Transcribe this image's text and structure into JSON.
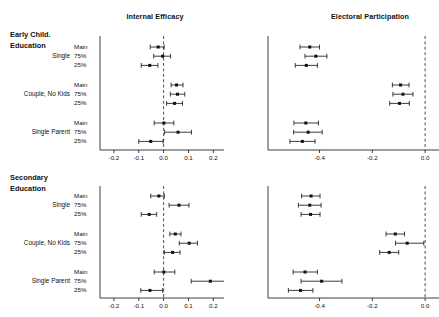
{
  "figure": {
    "width": 439,
    "height": 317,
    "background": "#ffffff",
    "ink_color": "#111111"
  },
  "panels": {
    "top_left_title": "Internal Efficacy",
    "top_right_title": "Electoral Participation",
    "row_block_1_line1": "Early Child.",
    "row_block_1_line2": "Education",
    "row_block_2_line1": "Secondary",
    "row_block_2_line2": "Education",
    "groups": [
      "Single",
      "Couple, No Kids",
      "Single Parent"
    ],
    "subrows": [
      "Main",
      "75%",
      "25%"
    ]
  },
  "axes": {
    "efficacy_ticks": [
      "-0.2",
      "-0.1",
      "0.0",
      "0.1",
      "0.2"
    ],
    "efficacy_tick_values": [
      -0.2,
      -0.1,
      0.0,
      0.1,
      0.2
    ],
    "efficacy_xlim": [
      -0.24,
      0.235
    ],
    "participation_ticks": [
      "-0.4",
      "-0.2",
      "0.0"
    ],
    "participation_tick_values": [
      -0.4,
      -0.2,
      0.0
    ],
    "participation_xlim": [
      -0.58,
      0.045
    ],
    "reference_line": 0.0,
    "grid": false
  },
  "chart_data": {
    "type": "scatter",
    "title": "",
    "subtitle": "",
    "xlabel": "",
    "ylabel": "",
    "legend_position": "none",
    "annotations": [
      "Dashed vertical line marks zero (no effect)"
    ],
    "panels": [
      {
        "row_block": "Early Child. Education",
        "column": "Internal Efficacy",
        "xlabel": "",
        "xlim": [
          -0.24,
          0.235
        ],
        "ticks": [
          -0.2,
          -0.1,
          0.0,
          0.1,
          0.2
        ],
        "points": [
          {
            "group": "Single",
            "spec": "Main",
            "estimate": -0.022,
            "ci_low": -0.054,
            "ci_high": 0.002
          },
          {
            "group": "Single",
            "spec": "75%",
            "estimate": -0.004,
            "ci_low": -0.04,
            "ci_high": 0.028
          },
          {
            "group": "Single",
            "spec": "25%",
            "estimate": -0.056,
            "ci_low": -0.09,
            "ci_high": -0.023
          },
          {
            "group": "Couple, No Kids",
            "spec": "Main",
            "estimate": 0.052,
            "ci_low": 0.03,
            "ci_high": 0.078
          },
          {
            "group": "Couple, No Kids",
            "spec": "75%",
            "estimate": 0.056,
            "ci_low": 0.027,
            "ci_high": 0.085
          },
          {
            "group": "Couple, No Kids",
            "spec": "25%",
            "estimate": 0.044,
            "ci_low": 0.012,
            "ci_high": 0.076
          },
          {
            "group": "Single Parent",
            "spec": "Main",
            "estimate": 0.001,
            "ci_low": -0.038,
            "ci_high": 0.041
          },
          {
            "group": "Single Parent",
            "spec": "75%",
            "estimate": 0.058,
            "ci_low": 0.004,
            "ci_high": 0.112
          },
          {
            "group": "Single Parent",
            "spec": "25%",
            "estimate": -0.052,
            "ci_low": -0.1,
            "ci_high": -0.002
          }
        ]
      },
      {
        "row_block": "Early Child. Education",
        "column": "Electoral Participation",
        "xlabel": "",
        "xlim": [
          -0.58,
          0.045
        ],
        "ticks": [
          -0.4,
          -0.2,
          0.0
        ],
        "points": [
          {
            "group": "Single",
            "spec": "Main",
            "estimate": -0.437,
            "ci_low": -0.474,
            "ci_high": -0.4
          },
          {
            "group": "Single",
            "spec": "75%",
            "estimate": -0.414,
            "ci_low": -0.455,
            "ci_high": -0.372
          },
          {
            "group": "Single",
            "spec": "25%",
            "estimate": -0.45,
            "ci_low": -0.492,
            "ci_high": -0.408
          },
          {
            "group": "Couple, No Kids",
            "spec": "Main",
            "estimate": -0.093,
            "ci_low": -0.124,
            "ci_high": -0.061
          },
          {
            "group": "Couple, No Kids",
            "spec": "75%",
            "estimate": -0.084,
            "ci_low": -0.122,
            "ci_high": -0.046
          },
          {
            "group": "Couple, No Kids",
            "spec": "25%",
            "estimate": -0.097,
            "ci_low": -0.134,
            "ci_high": -0.06
          },
          {
            "group": "Single Parent",
            "spec": "Main",
            "estimate": -0.452,
            "ci_low": -0.497,
            "ci_high": -0.404
          },
          {
            "group": "Single Parent",
            "spec": "75%",
            "estimate": -0.443,
            "ci_low": -0.498,
            "ci_high": -0.39
          },
          {
            "group": "Single Parent",
            "spec": "25%",
            "estimate": -0.465,
            "ci_low": -0.512,
            "ci_high": -0.417
          }
        ]
      },
      {
        "row_block": "Secondary Education",
        "column": "Internal Efficacy",
        "xlabel": "",
        "xlim": [
          -0.24,
          0.235
        ],
        "ticks": [
          -0.2,
          -0.1,
          0.0,
          0.1,
          0.2
        ],
        "points": [
          {
            "group": "Single",
            "spec": "Main",
            "estimate": -0.019,
            "ci_low": -0.052,
            "ci_high": 0.003
          },
          {
            "group": "Single",
            "spec": "75%",
            "estimate": 0.062,
            "ci_low": 0.022,
            "ci_high": 0.102
          },
          {
            "group": "Single",
            "spec": "25%",
            "estimate": -0.058,
            "ci_low": -0.09,
            "ci_high": -0.028
          },
          {
            "group": "Couple, No Kids",
            "spec": "Main",
            "estimate": 0.047,
            "ci_low": 0.025,
            "ci_high": 0.07
          },
          {
            "group": "Couple, No Kids",
            "spec": "75%",
            "estimate": 0.103,
            "ci_low": 0.063,
            "ci_high": 0.136
          },
          {
            "group": "Couple, No Kids",
            "spec": "25%",
            "estimate": 0.036,
            "ci_low": 0.003,
            "ci_high": 0.066
          },
          {
            "group": "Single Parent",
            "spec": "Main",
            "estimate": 0.001,
            "ci_low": -0.038,
            "ci_high": 0.045
          },
          {
            "group": "Single Parent",
            "spec": "75%",
            "estimate": 0.188,
            "ci_low": 0.111,
            "ci_high": 0.248
          },
          {
            "group": "Single Parent",
            "spec": "25%",
            "estimate": -0.055,
            "ci_low": -0.092,
            "ci_high": -0.004
          }
        ]
      },
      {
        "row_block": "Secondary Education",
        "column": "Electoral Participation",
        "xlabel": "",
        "xlim": [
          -0.58,
          0.045
        ],
        "ticks": [
          -0.4,
          -0.2,
          0.0
        ],
        "points": [
          {
            "group": "Single",
            "spec": "Main",
            "estimate": -0.432,
            "ci_low": -0.468,
            "ci_high": -0.398
          },
          {
            "group": "Single",
            "spec": "75%",
            "estimate": -0.437,
            "ci_low": -0.48,
            "ci_high": -0.394
          },
          {
            "group": "Single",
            "spec": "25%",
            "estimate": -0.434,
            "ci_low": -0.47,
            "ci_high": -0.398
          },
          {
            "group": "Couple, No Kids",
            "spec": "Main",
            "estimate": -0.113,
            "ci_low": -0.148,
            "ci_high": -0.078
          },
          {
            "group": "Couple, No Kids",
            "spec": "75%",
            "estimate": -0.068,
            "ci_low": -0.112,
            "ci_high": -0.005
          },
          {
            "group": "Couple, No Kids",
            "spec": "25%",
            "estimate": -0.136,
            "ci_low": -0.172,
            "ci_high": -0.1
          },
          {
            "group": "Single Parent",
            "spec": "Main",
            "estimate": -0.455,
            "ci_low": -0.5,
            "ci_high": -0.408
          },
          {
            "group": "Single Parent",
            "spec": "75%",
            "estimate": -0.392,
            "ci_low": -0.47,
            "ci_high": -0.315
          },
          {
            "group": "Single Parent",
            "spec": "25%",
            "estimate": -0.472,
            "ci_low": -0.518,
            "ci_high": -0.425
          }
        ]
      }
    ]
  }
}
